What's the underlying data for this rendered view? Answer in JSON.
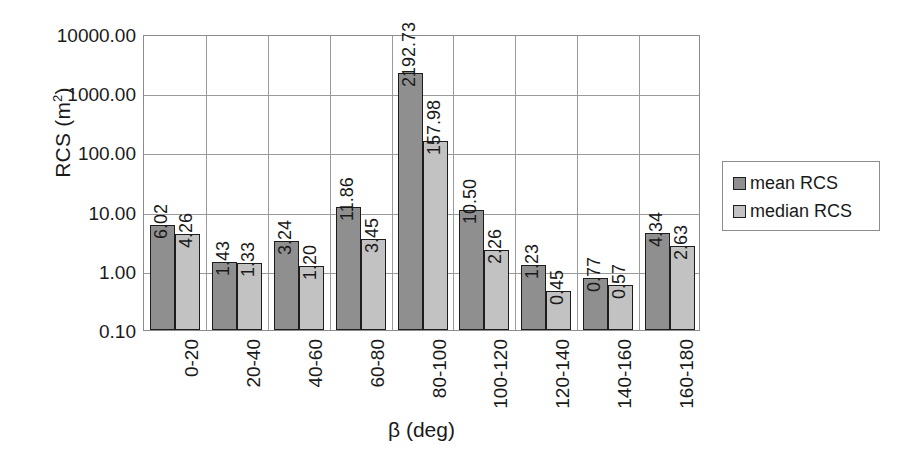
{
  "chart_data": {
    "type": "bar",
    "title": "",
    "xlabel": "β (deg)",
    "ylabel": "RCS (m²)",
    "ylabel_base": "RCS (m",
    "ylabel_sup": "2",
    "ylabel_tail": ")",
    "yscale": "log",
    "ylim": [
      0.1,
      10000.0
    ],
    "grid": true,
    "legend_position": "right",
    "categories": [
      "0-20",
      "20-40",
      "40-60",
      "60-80",
      "80-100",
      "100-120",
      "120-140",
      "140-160",
      "160-180"
    ],
    "ytick_labels": [
      "0.10",
      "1.00",
      "10.00",
      "100.00",
      "1000.00",
      "10000.00"
    ],
    "ytick_values": [
      0.1,
      1.0,
      10.0,
      100.0,
      1000.0,
      10000.0
    ],
    "series": [
      {
        "name": "mean RCS",
        "color": "#8f8f8f",
        "values": [
          6.02,
          1.43,
          3.24,
          11.86,
          2192.73,
          10.5,
          1.23,
          0.77,
          4.34
        ],
        "labels": [
          "6.02",
          "1.43",
          "3.24",
          "11.86",
          "2192.73",
          "10.50",
          "1.23",
          "0.77",
          "4.34"
        ]
      },
      {
        "name": "median RCS",
        "color": "#c2c2c2",
        "values": [
          4.26,
          1.33,
          1.2,
          3.45,
          157.98,
          2.26,
          0.45,
          0.57,
          2.63
        ],
        "labels": [
          "4.26",
          "1.33",
          "1.20",
          "3.45",
          "157.98",
          "2.26",
          "0.45",
          "0.57",
          "2.63"
        ]
      }
    ]
  },
  "legend": {
    "items": [
      {
        "label": "mean RCS",
        "swatch": "mean"
      },
      {
        "label": "median RCS",
        "swatch": "median"
      }
    ]
  }
}
